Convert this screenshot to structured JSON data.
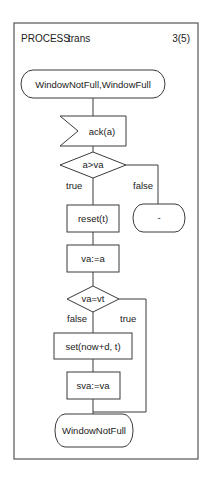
{
  "header": {
    "keyword": "PROCESS",
    "name": "trans",
    "page": "3(5)"
  },
  "nodes": {
    "start_state": "WindowNotFull,WindowFull",
    "input": "ack(a)",
    "decision1": "a>va",
    "decision1_true": "true",
    "decision1_false": "false",
    "false_state": "-",
    "task_reset": "reset(t)",
    "task_assign_va": "va:=a",
    "decision2": "va=vt",
    "decision2_false": "false",
    "decision2_true": "true",
    "task_set": "set(now+d, t)",
    "task_assign_sva": "sva:=va",
    "end_state": "WindowNotFull"
  }
}
